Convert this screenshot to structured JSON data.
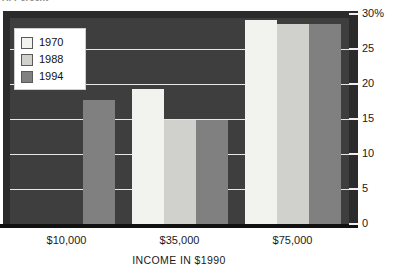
{
  "figure": {
    "top_cropped_caption": "A. Percent"
  },
  "chart_data": {
    "type": "bar",
    "title": "",
    "xlabel": "INCOME IN $1990",
    "ylabel": "",
    "categories": [
      "$10,000",
      "$35,000",
      "$75,000"
    ],
    "series": [
      {
        "name": "1970",
        "color": "#f2f2ef",
        "values": [
          0.0,
          19.3,
          29.2
        ]
      },
      {
        "name": "1988",
        "color": "#d0d0cd",
        "values": [
          0.0,
          14.9,
          28.6
        ]
      },
      {
        "name": "1994",
        "color": "#808080",
        "values": [
          17.7,
          14.9,
          28.6
        ]
      }
    ],
    "ylim": [
      0,
      30
    ],
    "yticks": [
      0,
      5,
      10,
      15,
      20,
      25,
      30
    ],
    "ytick_labels": [
      "0",
      "5",
      "10",
      "15",
      "20",
      "25",
      "30%"
    ],
    "grid": true,
    "legend_position": "upper-left",
    "plot_background": "#3e3e3e",
    "gridline_color": "#e8e8e8",
    "note": "In the $10,000 group the 1970 and 1988 bars render in the same dark tone as the plot background and are not distinguishable."
  },
  "legend": {
    "items": [
      {
        "label": "1970"
      },
      {
        "label": "1988"
      },
      {
        "label": "1994"
      }
    ]
  }
}
